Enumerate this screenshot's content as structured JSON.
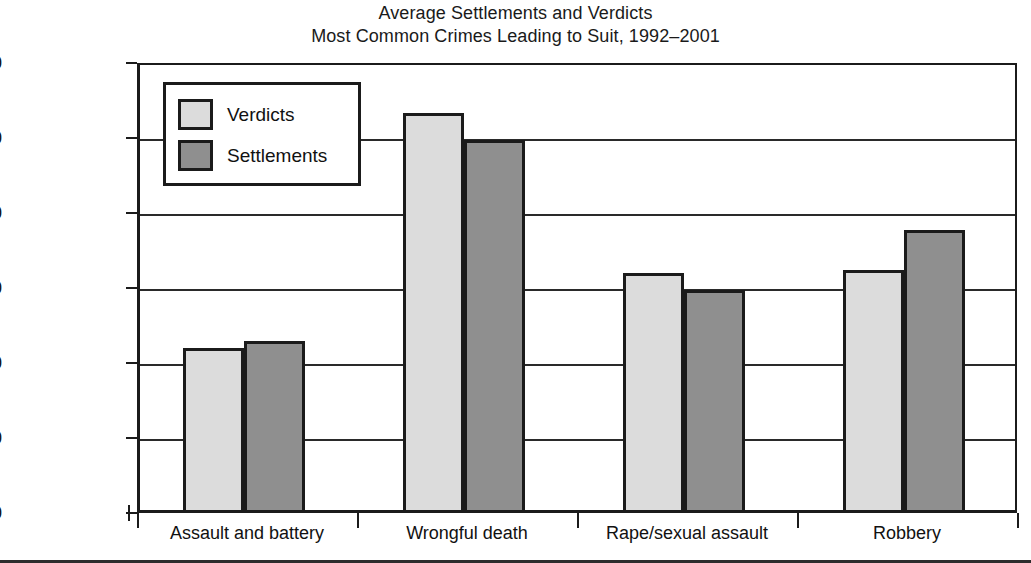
{
  "chart_data": {
    "type": "bar",
    "title": "Average Settlements and Verdicts",
    "subtitle": "Most Common Crimes Leading to Suit, 1992–2001",
    "xlabel": "",
    "ylabel": "",
    "ylim": [
      0,
      3000000
    ],
    "ytick_values": [
      3000000,
      2500000,
      2000000,
      1500000,
      1000000,
      500000,
      0
    ],
    "ytick_labels": [
      "$3,000,000",
      "$2,500,000",
      "$2,000,000",
      "$1,500,000",
      "$1,000,000",
      "$500,000",
      "$0"
    ],
    "grid": true,
    "legend_position": "upper-left-inside",
    "categories": [
      "Assault and battery",
      "Wrongful death",
      "Rape/sexual assault",
      "Robbery"
    ],
    "series": [
      {
        "name": "Verdicts",
        "color": "#dcdcdc",
        "values": [
          1100000,
          2670000,
          1600000,
          1620000
        ]
      },
      {
        "name": "Settlements",
        "color": "#8f8f8f",
        "values": [
          1150000,
          2490000,
          1490000,
          1890000
        ]
      }
    ]
  },
  "colors": {
    "verdicts": "#dcdcdc",
    "settlements": "#8f8f8f",
    "axis": "#1b1b1b",
    "background": "#ffffff"
  }
}
